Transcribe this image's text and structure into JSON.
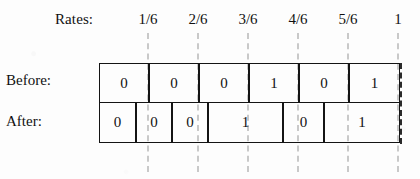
{
  "figure": {
    "rates_label": "Rates:",
    "rate_ticks": [
      {
        "label": "1/6",
        "x": 148
      },
      {
        "label": "2/6",
        "x": 198
      },
      {
        "label": "3/6",
        "x": 248
      },
      {
        "label": "4/6",
        "x": 298
      },
      {
        "label": "5/6",
        "x": 348
      },
      {
        "label": "1",
        "x": 398
      }
    ],
    "guides_x": [
      148,
      198,
      248,
      298,
      348,
      398
    ],
    "rows": [
      {
        "name": "before",
        "label": "Before:",
        "cells": [
          {
            "value": "0",
            "left": 0,
            "width": 50
          },
          {
            "value": "0",
            "left": 50,
            "width": 50
          },
          {
            "value": "0",
            "left": 100,
            "width": 50
          },
          {
            "value": "1",
            "left": 150,
            "width": 50
          },
          {
            "value": "0",
            "left": 200,
            "width": 50
          },
          {
            "value": "1",
            "left": 250,
            "width": 51
          }
        ]
      },
      {
        "name": "after",
        "label": "After:",
        "cells": [
          {
            "value": "0",
            "left": 0,
            "width": 37
          },
          {
            "value": "0",
            "left": 37,
            "width": 36
          },
          {
            "value": "0",
            "left": 73,
            "width": 36
          },
          {
            "value": "1",
            "left": 109,
            "width": 75
          },
          {
            "value": "0",
            "left": 184,
            "width": 41
          },
          {
            "value": "1",
            "left": 225,
            "width": 76
          }
        ]
      }
    ],
    "colors": {
      "ink": "#141414",
      "guide": "#c9c9c9",
      "paper": "#fdfdfd"
    }
  }
}
